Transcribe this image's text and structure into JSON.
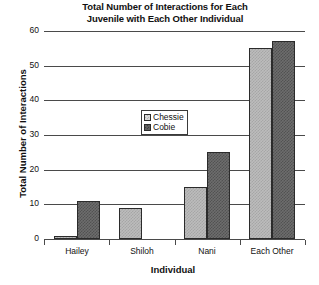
{
  "chart_data": {
    "type": "bar",
    "title": "Total Number of Interactions for Each Juvenile with Each Other Individual",
    "title_line1": "Total Number of Interactions for Each",
    "title_line2": "Juvenile with Each Other Individual",
    "xlabel": "Individual",
    "ylabel": "Total Number of Interactions",
    "categories": [
      "Hailey",
      "Shiloh",
      "Nani",
      "Each Other"
    ],
    "ylim": [
      0,
      60
    ],
    "yticks": [
      0,
      10,
      20,
      30,
      40,
      50,
      60
    ],
    "ytick_labels": [
      "0",
      "10",
      "20",
      "30",
      "40",
      "50",
      "60"
    ],
    "grid": true,
    "legend_position": "center",
    "series": [
      {
        "name": "Chessie",
        "color": "#bcbcbc",
        "values": [
          1,
          9,
          15,
          55
        ]
      },
      {
        "name": "Cobie",
        "color": "#6d6d6d",
        "values": [
          11,
          0,
          25,
          57
        ]
      }
    ]
  }
}
